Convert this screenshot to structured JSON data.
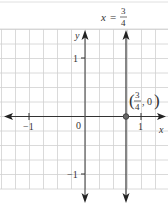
{
  "chart_data": {
    "type": "line",
    "title_parts": {
      "var": "x",
      "eq": "=",
      "num": "3",
      "den": "4"
    },
    "xlabel": "x",
    "ylabel": "y",
    "xlim": [
      -1.5,
      1.4
    ],
    "ylim": [
      -1.25,
      1.5
    ],
    "grid": true,
    "x_ticks": [
      {
        "value": -1,
        "label": "−1"
      },
      {
        "value": 1,
        "label": "1"
      }
    ],
    "y_ticks": [
      {
        "value": 1,
        "label": "1"
      },
      {
        "value": -1,
        "label": "−1"
      }
    ],
    "origin_label": "0",
    "series": [
      {
        "name": "x = 3/4",
        "kind": "vertical-line",
        "x": 0.75,
        "color": "#555555"
      }
    ],
    "points": [
      {
        "x": 0.75,
        "y": 0,
        "label": "(3/4, 0)",
        "label_num": "3",
        "label_den": "4",
        "label_y": "0"
      }
    ]
  },
  "colors": {
    "grid": "#d0d0d0",
    "axis": "#333333",
    "line": "#555555"
  }
}
